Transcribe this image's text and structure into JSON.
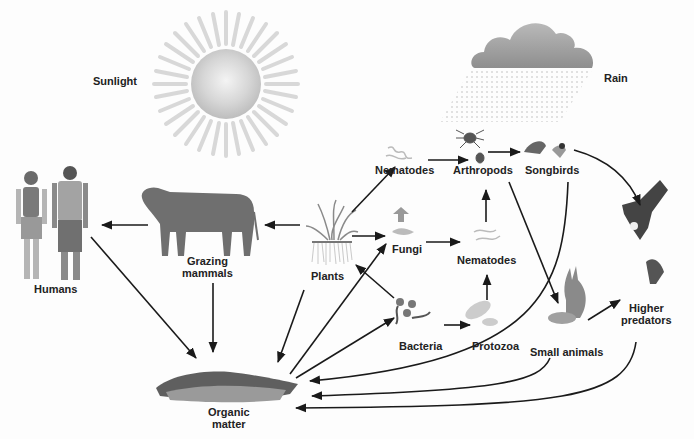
{
  "diagram": {
    "type": "food-web",
    "labels": {
      "sunlight": "Sunlight",
      "rain": "Rain",
      "humans": "Humans",
      "grazing_mammals": "Grazing\nmammals",
      "plants": "Plants",
      "nematodes_top": "Nematodes",
      "arthropods": "Arthropods",
      "songbirds": "Songbirds",
      "fungi": "Fungi",
      "nematodes_mid": "Nematodes",
      "bacteria": "Bacteria",
      "protozoa": "Protozoa",
      "small_animals": "Small animals",
      "higher_predators": "Higher\npredators",
      "organic_matter": "Organic\nmatter"
    },
    "nodes": [
      "Sunlight",
      "Rain",
      "Humans",
      "Grazing mammals",
      "Plants",
      "Nematodes (root-feeding)",
      "Arthropods",
      "Songbirds",
      "Fungi",
      "Nematodes",
      "Bacteria",
      "Protozoa",
      "Small animals",
      "Higher predators",
      "Organic matter"
    ],
    "edges": [
      {
        "from": "Grazing mammals",
        "to": "Humans"
      },
      {
        "from": "Plants",
        "to": "Grazing mammals"
      },
      {
        "from": "Plants",
        "to": "Nematodes (root-feeding)"
      },
      {
        "from": "Plants",
        "to": "Fungi"
      },
      {
        "from": "Bacteria",
        "to": "Plants"
      },
      {
        "from": "Nematodes (root-feeding)",
        "to": "Arthropods"
      },
      {
        "from": "Arthropods",
        "to": "Songbirds"
      },
      {
        "from": "Arthropods",
        "to": "Small animals"
      },
      {
        "from": "Fungi",
        "to": "Nematodes"
      },
      {
        "from": "Nematodes",
        "to": "Arthropods"
      },
      {
        "from": "Bacteria",
        "to": "Protozoa"
      },
      {
        "from": "Protozoa",
        "to": "Nematodes"
      },
      {
        "from": "Songbirds",
        "to": "Higher predators"
      },
      {
        "from": "Small animals",
        "to": "Higher predators"
      },
      {
        "from": "Humans",
        "to": "Organic matter"
      },
      {
        "from": "Grazing mammals",
        "to": "Organic matter"
      },
      {
        "from": "Plants",
        "to": "Organic matter"
      },
      {
        "from": "Organic matter",
        "to": "Fungi"
      },
      {
        "from": "Organic matter",
        "to": "Bacteria"
      },
      {
        "from": "Songbirds",
        "to": "Organic matter"
      },
      {
        "from": "Small animals",
        "to": "Organic matter"
      },
      {
        "from": "Higher predators",
        "to": "Organic matter"
      }
    ],
    "colors": {
      "arrow": "#1a1a1a",
      "label": "#222222",
      "sun": "#c8c8c8",
      "cloud": "#9a9a9a",
      "organism": "#6e6e6e"
    }
  }
}
